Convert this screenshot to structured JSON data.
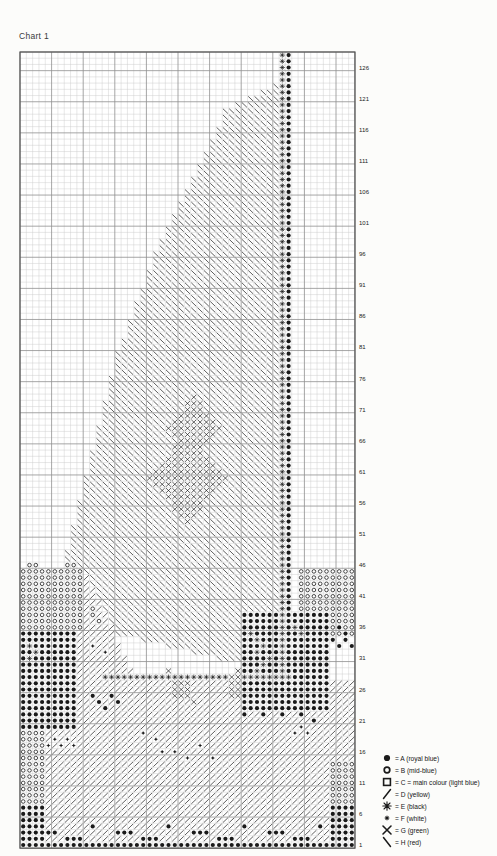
{
  "page": {
    "title": "Chart 1"
  },
  "chart": {
    "cols": 53,
    "rows": 128,
    "row_labels": [
      126,
      121,
      116,
      111,
      106,
      101,
      96,
      91,
      86,
      81,
      76,
      71,
      66,
      61,
      56,
      51,
      46,
      41,
      36,
      31,
      26,
      21,
      16,
      11,
      6,
      1
    ],
    "label_step": 5,
    "ink_color": "#1a1a1a",
    "minor_grid_color": "#cccccc",
    "major_grid_color": "#8f8f8f",
    "border_color": "#555555",
    "paper_color": "#ffffff"
  },
  "legend": {
    "items": [
      {
        "sym": "@",
        "icon": "filled-circle",
        "label": "= A (royal blue)"
      },
      {
        "sym": "o",
        "icon": "open-circle",
        "label": "= B (mid-blue)"
      },
      {
        "sym": "#",
        "icon": "open-square",
        "label": "= C = main colour (light blue)"
      },
      {
        "sym": "/",
        "icon": "slash",
        "label": "= D (yellow)"
      },
      {
        "sym": "*",
        "icon": "asterisk",
        "label": "= E (black)"
      },
      {
        "sym": "+",
        "icon": "small-star",
        "label": "= F (white)"
      },
      {
        "sym": "X",
        "icon": "cross-x",
        "label": "= G (green)"
      },
      {
        "sym": "\\",
        "icon": "backslash",
        "label": "= H (red)"
      }
    ]
  },
  "pattern": {
    "regions": [
      {
        "shape": "poly",
        "sym": "\\",
        "pts": [
          [
            5.6,
            41.6
          ],
          [
            10,
            33
          ],
          [
            21,
            28
          ],
          [
            33,
            22
          ],
          [
            49,
            16
          ],
          [
            81,
            8
          ],
          [
            91.4,
            5.6
          ],
          [
            100.5,
            41.6
          ]
        ]
      },
      {
        "shape": "poly",
        "sym": "/",
        "pts": [
          [
            84.5,
            11
          ],
          [
            103.5,
            3.6
          ],
          [
            103.5,
            20
          ]
        ]
      },
      {
        "shape": "poly",
        "sym": "X",
        "pts": [
          [
            55.6,
            28
          ],
          [
            61,
            23.6
          ],
          [
            66.4,
            28
          ],
          [
            61,
            32.4
          ]
        ]
      },
      {
        "shape": "poly",
        "sym": "X",
        "pts": [
          [
            61.6,
            27
          ],
          [
            69,
            20.6
          ],
          [
            76.4,
            27
          ],
          [
            69,
            33.4
          ]
        ]
      },
      {
        "shape": "rect",
        "sym": "/",
        "r1": 102,
        "r2": 128,
        "c1": 1,
        "c2": 53
      },
      {
        "shape": "rect",
        "sym": "o",
        "r1": 84,
        "r2": 93,
        "c1": 1,
        "c2": 10
      },
      {
        "shape": "cells",
        "sym": "o",
        "cells": [
          [
            83,
            2
          ],
          [
            83,
            3
          ],
          [
            83,
            8
          ],
          [
            83,
            9
          ],
          [
            90,
            12
          ],
          [
            91,
            12
          ],
          [
            92,
            13
          ]
        ]
      },
      {
        "shape": "rect",
        "sym": "@",
        "r1": 94,
        "r2": 109,
        "c1": 1,
        "c2": 9
      },
      {
        "shape": "rect",
        "sym": "o",
        "r1": 110,
        "r2": 121,
        "c1": 1,
        "c2": 4
      },
      {
        "shape": "rect",
        "sym": "@",
        "r1": 122,
        "r2": 127,
        "c1": 1,
        "c2": 4
      },
      {
        "shape": "rect",
        "sym": "o",
        "r1": 84,
        "r2": 90,
        "c1": 45,
        "c2": 53
      },
      {
        "shape": "rect",
        "sym": "@",
        "r1": 91,
        "r2": 106,
        "c1": 36,
        "c2": 49
      },
      {
        "shape": "rect",
        "sym": "o",
        "r1": 91,
        "r2": 94,
        "c1": 50,
        "c2": 53
      },
      {
        "shape": "cells",
        "sym": "@",
        "cells": [
          [
            93,
            51
          ],
          [
            94,
            52
          ],
          [
            95,
            50
          ],
          [
            95,
            52
          ],
          [
            96,
            51
          ],
          [
            96,
            53
          ]
        ]
      },
      {
        "shape": "rect",
        "sym": "o",
        "r1": 115,
        "r2": 121,
        "c1": 50,
        "c2": 53
      },
      {
        "shape": "rect",
        "sym": "@",
        "r1": 122,
        "r2": 127,
        "c1": 50,
        "c2": 53
      },
      {
        "shape": "rect",
        "sym": "*",
        "r1": 1,
        "r2": 100,
        "c1": 42,
        "c2": 42
      },
      {
        "shape": "rect",
        "sym": "@",
        "r1": 1,
        "r2": 100,
        "c1": 43,
        "c2": 43
      },
      {
        "shape": "rect",
        "sym": "*",
        "r1": 101,
        "r2": 101,
        "c1": 14,
        "c2": 43
      },
      {
        "shape": "rect",
        "sym": "X",
        "r1": 102,
        "r2": 104,
        "c1": 25,
        "c2": 27
      },
      {
        "shape": "rect",
        "sym": "X",
        "r1": 101,
        "r2": 104,
        "c1": 34,
        "c2": 35
      },
      {
        "shape": "cells",
        "sym": "X",
        "cells": [
          [
            100,
            24
          ],
          [
            105,
            28
          ],
          [
            100,
            35
          ]
        ]
      },
      {
        "shape": "rect",
        "sym": "@",
        "r1": 128,
        "r2": 128,
        "c1": 1,
        "c2": 53
      },
      {
        "shape": "cells",
        "sym": "@",
        "cells": [
          [
            126,
            4
          ],
          [
            126,
            5
          ],
          [
            126,
            6
          ],
          [
            127,
            8
          ],
          [
            127,
            9
          ],
          [
            127,
            10
          ],
          [
            126,
            16
          ],
          [
            126,
            17
          ],
          [
            126,
            18
          ],
          [
            127,
            20
          ],
          [
            127,
            21
          ],
          [
            127,
            22
          ],
          [
            126,
            28
          ],
          [
            126,
            29
          ],
          [
            126,
            30
          ],
          [
            127,
            32
          ],
          [
            127,
            33
          ],
          [
            127,
            34
          ],
          [
            126,
            40
          ],
          [
            126,
            41
          ],
          [
            126,
            42
          ],
          [
            127,
            44
          ],
          [
            127,
            45
          ],
          [
            127,
            46
          ],
          [
            125,
            12
          ],
          [
            125,
            24
          ],
          [
            125,
            36
          ],
          [
            125,
            48
          ]
        ]
      },
      {
        "shape": "cells",
        "sym": "@",
        "cells": [
          [
            104,
            12
          ],
          [
            104,
            15
          ],
          [
            105,
            13
          ],
          [
            105,
            16
          ],
          [
            106,
            14
          ],
          [
            105,
            37
          ],
          [
            105,
            40
          ],
          [
            105,
            43
          ],
          [
            105,
            46
          ],
          [
            106,
            38
          ],
          [
            106,
            41
          ],
          [
            106,
            44
          ],
          [
            107,
            36
          ],
          [
            107,
            39
          ],
          [
            107,
            42
          ],
          [
            107,
            45
          ],
          [
            108,
            47
          ],
          [
            104,
            48
          ]
        ]
      },
      {
        "shape": "cells",
        "sym": "+",
        "cells": [
          [
            111,
            6
          ],
          [
            111,
            8
          ],
          [
            112,
            5
          ],
          [
            112,
            7
          ],
          [
            112,
            9
          ],
          [
            113,
            23
          ],
          [
            113,
            25
          ],
          [
            114,
            27
          ],
          [
            112,
            29
          ],
          [
            114,
            31
          ],
          [
            110,
            44
          ],
          [
            110,
            46
          ],
          [
            109,
            45
          ],
          [
            96,
            12
          ],
          [
            97,
            14
          ],
          [
            110,
            20
          ],
          [
            111,
            22
          ]
        ]
      },
      {
        "shape": "cells",
        "sym": "*",
        "cells": [
          [
            95,
            38
          ],
          [
            96,
            39
          ],
          [
            97,
            38
          ],
          [
            98,
            40
          ],
          [
            99,
            39
          ],
          [
            94,
            37
          ],
          [
            100,
            38
          ],
          [
            96,
            2
          ],
          [
            97,
            3
          ],
          [
            98,
            2
          ],
          [
            93,
            44
          ],
          [
            94,
            45
          ]
        ]
      }
    ]
  }
}
